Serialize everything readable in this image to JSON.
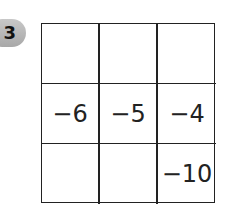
{
  "badge": {
    "label": "3"
  },
  "grid": {
    "rows": 3,
    "cols": 3,
    "cells": [
      [
        "",
        "",
        ""
      ],
      [
        "−6",
        "−5",
        "−4"
      ],
      [
        "",
        "",
        "−10"
      ]
    ]
  }
}
